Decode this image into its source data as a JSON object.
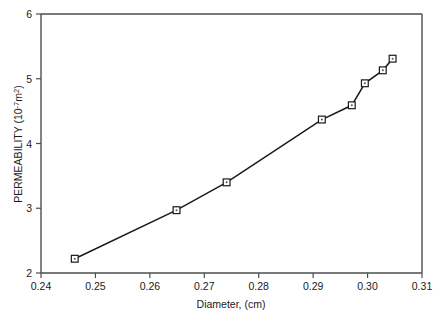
{
  "chart_data": {
    "type": "line",
    "title": "",
    "xlabel": "Diameter, (cm)",
    "ylabel": "PERMEABILITY (10",
    "ylabel_exponent": "-7",
    "ylabel_unit": "m",
    "ylabel_unit_exponent": "2",
    "ylabel_close": ")",
    "ylabel_full": "PERMEABILITY (10 -7 m 2 )",
    "xlim": [
      0.24,
      0.31
    ],
    "ylim": [
      2,
      6
    ],
    "grid": false,
    "legend": "none",
    "marker_style": "open-square",
    "line_color": "#1a1a1a",
    "xticks": [
      "0.24",
      "0.25",
      "0.26",
      "0.27",
      "0.28",
      "0.29",
      "0.30",
      "0.31"
    ],
    "xtick_values": [
      0.24,
      0.25,
      0.26,
      0.27,
      0.28,
      0.29,
      0.3,
      0.31
    ],
    "yticks": [
      "2",
      "3",
      "4",
      "5",
      "6"
    ],
    "ytick_values": [
      2,
      3,
      4,
      5,
      6
    ],
    "x": [
      0.2462,
      0.2649,
      0.2741,
      0.2916,
      0.2971,
      0.2995,
      0.3028,
      0.3046
    ],
    "values": [
      2.22,
      2.97,
      3.4,
      4.37,
      4.59,
      4.93,
      5.13,
      5.31
    ],
    "series": [
      {
        "name": "Permeability vs Diameter",
        "points": [
          {
            "x": 0.2462,
            "y": 2.22
          },
          {
            "x": 0.2649,
            "y": 2.97
          },
          {
            "x": 0.2741,
            "y": 3.4
          },
          {
            "x": 0.2916,
            "y": 4.37
          },
          {
            "x": 0.2971,
            "y": 4.59
          },
          {
            "x": 0.2995,
            "y": 4.93
          },
          {
            "x": 0.3028,
            "y": 5.13
          },
          {
            "x": 0.3046,
            "y": 5.31
          }
        ]
      }
    ]
  }
}
